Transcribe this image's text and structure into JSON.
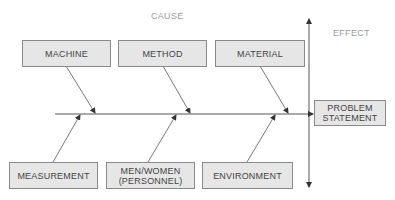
{
  "diagram": {
    "type": "fishbone",
    "cause_label": "CAUSE",
    "effect_label": "EFFECT",
    "effect": "PROBLEM\nSTATEMENT",
    "top_causes": [
      {
        "label": "MACHINE"
      },
      {
        "label": "METHOD"
      },
      {
        "label": "MATERIAL"
      }
    ],
    "bottom_causes": [
      {
        "label": "MEASUREMENT"
      },
      {
        "label": "MEN/WOMEN\n(PERSONNEL)"
      },
      {
        "label": "ENVIRONMENT"
      }
    ],
    "colors": {
      "box_fill": "#e6e6e6",
      "box_border": "#8a8a8a",
      "line": "#555555",
      "label_text": "#9a9a9a",
      "box_text": "#444444"
    }
  }
}
